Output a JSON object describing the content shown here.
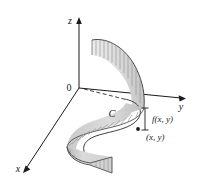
{
  "figure": {
    "name": "line-integral-curtain-surface",
    "background_color": "#ffffff",
    "stroke_color": "#1a1a1a",
    "surface_fill_light": "#e6e6e6",
    "surface_fill_mid": "#d2d2d2",
    "surface_fill_dark": "#b4b4b4",
    "ruling_line_color": "#8c8c8c"
  },
  "axes": {
    "z_label": "z",
    "y_label": "y",
    "x_label": "x",
    "origin_label": "0"
  },
  "annotations": {
    "curve_label": "C",
    "height_label": "f(x, y)",
    "point_label": "(x, y)"
  },
  "geometry": {
    "origin": {
      "x": 79,
      "y": 88
    },
    "z_axis_tip": {
      "x": 79,
      "y": 18
    },
    "y_axis_tip": {
      "x": 186,
      "y": 98
    },
    "x_axis_tip": {
      "x": 22,
      "y": 170
    },
    "ruling_count": 12,
    "point_marker": {
      "x": 138,
      "y": 129
    }
  }
}
